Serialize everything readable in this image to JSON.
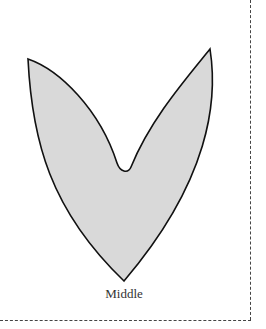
{
  "template": {
    "caption": "Middle",
    "shape": {
      "name": "middle-petal",
      "fill": "#d9d9d9",
      "stroke": "#111111"
    },
    "cut_line": {
      "style": "dashed",
      "color": "#444444"
    }
  }
}
